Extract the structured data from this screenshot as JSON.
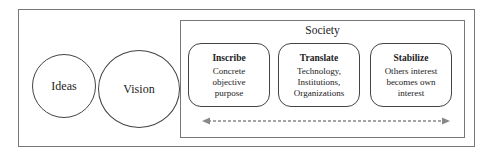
{
  "diagram": {
    "circles": [
      {
        "label": "Ideas"
      },
      {
        "label": "Vision"
      }
    ],
    "container": {
      "label": "Society"
    },
    "stages": [
      {
        "title": "Inscribe",
        "lines": [
          "Concrete",
          "objective",
          "purpose"
        ]
      },
      {
        "title": "Translate",
        "lines": [
          "Technology,",
          "Institutions,",
          "Organizations"
        ]
      },
      {
        "title": "Stabilize",
        "lines": [
          "Others interest",
          "becomes own",
          "interest"
        ]
      }
    ],
    "arrow": {
      "type": "bidirectional-dashed",
      "color": "#888888"
    }
  }
}
